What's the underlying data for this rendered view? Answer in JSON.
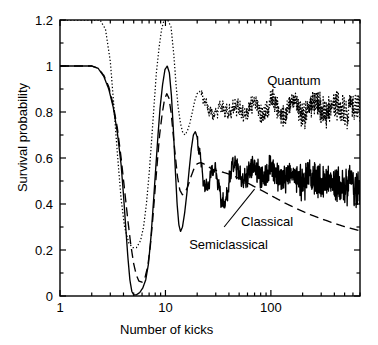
{
  "chart_data": {
    "type": "line",
    "title": "",
    "xlabel": "Number of kicks",
    "ylabel": "Survival probability",
    "xscale": "log",
    "xlim": [
      1,
      700
    ],
    "ylim": [
      0,
      1.2
    ],
    "xticks": [
      1,
      10,
      100
    ],
    "xtick_labels": [
      "1",
      "10",
      "100"
    ],
    "yticks": [
      0,
      0.2,
      0.4,
      0.6,
      0.8,
      1,
      1.2
    ],
    "ytick_labels": [
      "0",
      "0.2",
      "0.4",
      "0.6",
      "0.8",
      "1",
      "1.2"
    ],
    "yminor_step": 0.1,
    "grid": false,
    "legend": "inline-annotations",
    "annotations": [
      {
        "text": "Quantum",
        "x": 170,
        "y": 0.93,
        "leader": false
      },
      {
        "text": "Classical",
        "x": 105,
        "y": 0.35,
        "leader": true
      },
      {
        "text": "Semiclassical",
        "x": 42,
        "y": 0.22,
        "leader": false
      }
    ],
    "series": [
      {
        "name": "Quantum",
        "style": "dotted",
        "color": "#000000",
        "points": [
          [
            1,
            1.2
          ],
          [
            1.6,
            1.2
          ],
          [
            2,
            1.2
          ],
          [
            2.4,
            1.2
          ],
          [
            2.7,
            1.16
          ],
          [
            3,
            1.02
          ],
          [
            3.2,
            0.86
          ],
          [
            3.5,
            0.62
          ],
          [
            3.8,
            0.42
          ],
          [
            4.1,
            0.3
          ],
          [
            4.5,
            0.23
          ],
          [
            4.9,
            0.21
          ],
          [
            5.3,
            0.21
          ],
          [
            5.8,
            0.24
          ],
          [
            6.2,
            0.3
          ],
          [
            6.6,
            0.4
          ],
          [
            7,
            0.53
          ],
          [
            7.4,
            0.68
          ],
          [
            7.8,
            0.83
          ],
          [
            8.2,
            0.97
          ],
          [
            8.7,
            1.08
          ],
          [
            9.2,
            1.16
          ],
          [
            9.7,
            1.2
          ],
          [
            10.5,
            1.2
          ],
          [
            11.3,
            1.17
          ],
          [
            12,
            1.05
          ],
          [
            12.6,
            0.92
          ],
          [
            13.2,
            0.82
          ],
          [
            13.9,
            0.75
          ],
          [
            14.6,
            0.71
          ],
          [
            15.4,
            0.7
          ],
          [
            16.2,
            0.72
          ],
          [
            17,
            0.75
          ],
          [
            18,
            0.8
          ],
          [
            19,
            0.85
          ],
          [
            20,
            0.88
          ],
          [
            21,
            0.89
          ],
          [
            22,
            0.875
          ],
          [
            23.5,
            0.85
          ],
          [
            25,
            0.82
          ],
          [
            26.5,
            0.8
          ],
          [
            28,
            0.79
          ],
          [
            29.5,
            0.795
          ],
          [
            31,
            0.81
          ],
          [
            33,
            0.825
          ],
          [
            35,
            0.82
          ],
          [
            37,
            0.805
          ],
          [
            39,
            0.795
          ],
          [
            41,
            0.8
          ],
          [
            43,
            0.815
          ],
          [
            46,
            0.83
          ],
          [
            49,
            0.82
          ],
          [
            52,
            0.8
          ],
          [
            55,
            0.785
          ],
          [
            58,
            0.79
          ],
          [
            62,
            0.81
          ],
          [
            66,
            0.83
          ],
          [
            70,
            0.845
          ],
          [
            74,
            0.83
          ],
          [
            78,
            0.805
          ],
          [
            83,
            0.785
          ],
          [
            88,
            0.79
          ],
          [
            93,
            0.81
          ],
          [
            99,
            0.835
          ],
          [
            105,
            0.85
          ],
          [
            111,
            0.835
          ],
          [
            118,
            0.81
          ],
          [
            125,
            0.79
          ],
          [
            132,
            0.785
          ],
          [
            140,
            0.8
          ],
          [
            148,
            0.825
          ],
          [
            157,
            0.845
          ],
          [
            166,
            0.85
          ],
          [
            176,
            0.835
          ],
          [
            187,
            0.81
          ],
          [
            198,
            0.79
          ],
          [
            210,
            0.785
          ],
          [
            222,
            0.8
          ],
          [
            236,
            0.82
          ],
          [
            250,
            0.84
          ],
          [
            265,
            0.845
          ],
          [
            281,
            0.83
          ],
          [
            298,
            0.81
          ],
          [
            316,
            0.795
          ],
          [
            335,
            0.79
          ],
          [
            355,
            0.8
          ],
          [
            376,
            0.82
          ],
          [
            399,
            0.835
          ],
          [
            423,
            0.84
          ],
          [
            448,
            0.83
          ],
          [
            475,
            0.81
          ],
          [
            503,
            0.795
          ],
          [
            533,
            0.79
          ],
          [
            565,
            0.8
          ],
          [
            599,
            0.815
          ],
          [
            635,
            0.83
          ],
          [
            673,
            0.835
          ],
          [
            700,
            0.825
          ]
        ],
        "noise_amp": 0.085,
        "noise_start": 22
      },
      {
        "name": "Semiclassical",
        "style": "solid",
        "color": "#000000",
        "points": [
          [
            1,
            1.0
          ],
          [
            1.5,
            1.0
          ],
          [
            2,
            1.0
          ],
          [
            2.3,
            0.99
          ],
          [
            2.6,
            0.955
          ],
          [
            2.9,
            0.9
          ],
          [
            3.2,
            0.82
          ],
          [
            3.5,
            0.71
          ],
          [
            3.8,
            0.57
          ],
          [
            4,
            0.44
          ],
          [
            4.2,
            0.3
          ],
          [
            4.4,
            0.17
          ],
          [
            4.6,
            0.07
          ],
          [
            4.8,
            0.02
          ],
          [
            5,
            0.005
          ],
          [
            5.3,
            0.005
          ],
          [
            5.7,
            0.015
          ],
          [
            6.1,
            0.035
          ],
          [
            6.5,
            0.07
          ],
          [
            6.9,
            0.14
          ],
          [
            7.3,
            0.26
          ],
          [
            7.7,
            0.41
          ],
          [
            8.1,
            0.56
          ],
          [
            8.5,
            0.7
          ],
          [
            8.9,
            0.82
          ],
          [
            9.4,
            0.92
          ],
          [
            9.9,
            0.985
          ],
          [
            10.4,
            1.0
          ],
          [
            10.9,
            0.97
          ],
          [
            11.4,
            0.87
          ],
          [
            11.9,
            0.72
          ],
          [
            12.4,
            0.55
          ],
          [
            12.9,
            0.4
          ],
          [
            13.4,
            0.31
          ],
          [
            13.9,
            0.28
          ],
          [
            14.5,
            0.3
          ],
          [
            15.2,
            0.36
          ],
          [
            16,
            0.45
          ],
          [
            16.8,
            0.55
          ],
          [
            17.6,
            0.64
          ],
          [
            18.4,
            0.7
          ],
          [
            19.2,
            0.715
          ],
          [
            20,
            0.69
          ],
          [
            21,
            0.63
          ],
          [
            22,
            0.56
          ],
          [
            23,
            0.5
          ],
          [
            24,
            0.47
          ],
          [
            25,
            0.47
          ],
          [
            26,
            0.5
          ],
          [
            27.5,
            0.545
          ],
          [
            29,
            0.555
          ],
          [
            30.5,
            0.53
          ],
          [
            32,
            0.48
          ],
          [
            33.5,
            0.43
          ],
          [
            35,
            0.4
          ],
          [
            37,
            0.41
          ],
          [
            39,
            0.46
          ],
          [
            41,
            0.52
          ],
          [
            43,
            0.565
          ],
          [
            45,
            0.575
          ],
          [
            48,
            0.555
          ],
          [
            51,
            0.52
          ],
          [
            54,
            0.5
          ],
          [
            57,
            0.505
          ],
          [
            61,
            0.53
          ],
          [
            65,
            0.555
          ],
          [
            69,
            0.565
          ],
          [
            73,
            0.55
          ],
          [
            78,
            0.525
          ],
          [
            83,
            0.51
          ],
          [
            88,
            0.515
          ],
          [
            94,
            0.535
          ],
          [
            100,
            0.55
          ],
          [
            106,
            0.545
          ],
          [
            113,
            0.525
          ],
          [
            120,
            0.51
          ],
          [
            128,
            0.505
          ],
          [
            136,
            0.515
          ],
          [
            145,
            0.53
          ],
          [
            154,
            0.535
          ],
          [
            164,
            0.525
          ],
          [
            174,
            0.51
          ],
          [
            185,
            0.5
          ],
          [
            197,
            0.5
          ],
          [
            210,
            0.51
          ],
          [
            223,
            0.52
          ],
          [
            237,
            0.52
          ],
          [
            252,
            0.51
          ],
          [
            268,
            0.5
          ],
          [
            285,
            0.49
          ],
          [
            303,
            0.49
          ],
          [
            322,
            0.495
          ],
          [
            343,
            0.5
          ],
          [
            365,
            0.5
          ],
          [
            388,
            0.495
          ],
          [
            412,
            0.485
          ],
          [
            438,
            0.48
          ],
          [
            466,
            0.478
          ],
          [
            495,
            0.48
          ],
          [
            526,
            0.483
          ],
          [
            559,
            0.482
          ],
          [
            594,
            0.477
          ],
          [
            632,
            0.47
          ],
          [
            672,
            0.467
          ],
          [
            700,
            0.468
          ]
        ],
        "noise_amp": 0.1,
        "noise_start": 20
      },
      {
        "name": "Classical",
        "style": "dashed",
        "color": "#000000",
        "points": [
          [
            1,
            1.0
          ],
          [
            1.5,
            1.0
          ],
          [
            2,
            1.0
          ],
          [
            2.3,
            0.99
          ],
          [
            2.6,
            0.96
          ],
          [
            2.9,
            0.91
          ],
          [
            3.2,
            0.83
          ],
          [
            3.5,
            0.73
          ],
          [
            3.8,
            0.6
          ],
          [
            4.1,
            0.46
          ],
          [
            4.4,
            0.33
          ],
          [
            4.7,
            0.22
          ],
          [
            5,
            0.14
          ],
          [
            5.3,
            0.09
          ],
          [
            5.6,
            0.065
          ],
          [
            6,
            0.06
          ],
          [
            6.4,
            0.08
          ],
          [
            6.8,
            0.13
          ],
          [
            7.2,
            0.22
          ],
          [
            7.6,
            0.34
          ],
          [
            8,
            0.47
          ],
          [
            8.4,
            0.59
          ],
          [
            8.8,
            0.7
          ],
          [
            9.3,
            0.79
          ],
          [
            9.8,
            0.855
          ],
          [
            10.3,
            0.88
          ],
          [
            10.8,
            0.86
          ],
          [
            11.3,
            0.8
          ],
          [
            11.8,
            0.71
          ],
          [
            12.4,
            0.61
          ],
          [
            13,
            0.52
          ],
          [
            13.7,
            0.46
          ],
          [
            14.5,
            0.44
          ],
          [
            15.4,
            0.45
          ],
          [
            16.4,
            0.48
          ],
          [
            17.5,
            0.52
          ],
          [
            18.7,
            0.555
          ],
          [
            20,
            0.575
          ],
          [
            21.5,
            0.58
          ],
          [
            23,
            0.575
          ],
          [
            25,
            0.565
          ],
          [
            27,
            0.555
          ],
          [
            29,
            0.548
          ],
          [
            31,
            0.545
          ],
          [
            34,
            0.54
          ],
          [
            37,
            0.535
          ],
          [
            40,
            0.53
          ],
          [
            44,
            0.523
          ],
          [
            48,
            0.515
          ],
          [
            53,
            0.505
          ],
          [
            58,
            0.495
          ],
          [
            64,
            0.485
          ],
          [
            70,
            0.475
          ],
          [
            77,
            0.465
          ],
          [
            85,
            0.455
          ],
          [
            93,
            0.445
          ],
          [
            102,
            0.435
          ],
          [
            112,
            0.425
          ],
          [
            123,
            0.415
          ],
          [
            135,
            0.405
          ],
          [
            148,
            0.396
          ],
          [
            163,
            0.387
          ],
          [
            179,
            0.378
          ],
          [
            196,
            0.37
          ],
          [
            215,
            0.362
          ],
          [
            236,
            0.354
          ],
          [
            259,
            0.347
          ],
          [
            284,
            0.34
          ],
          [
            312,
            0.333
          ],
          [
            342,
            0.327
          ],
          [
            375,
            0.32
          ],
          [
            412,
            0.314
          ],
          [
            452,
            0.308
          ],
          [
            496,
            0.302
          ],
          [
            544,
            0.297
          ],
          [
            597,
            0.292
          ],
          [
            655,
            0.287
          ],
          [
            700,
            0.284
          ]
        ],
        "noise_amp": 0,
        "noise_start": 0
      }
    ]
  },
  "figure": {
    "axis_color": "#000000",
    "background": "#ffffff"
  }
}
